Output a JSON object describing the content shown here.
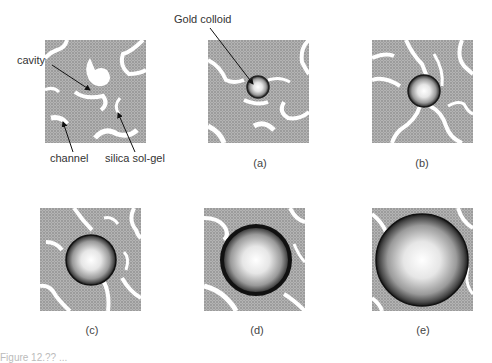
{
  "figure": {
    "annotations": {
      "cavity": "cavity",
      "channel": "channel",
      "silica": "silica sol-gel",
      "gold": "Gold colloid"
    },
    "panels": [
      {
        "id": "initial",
        "label": "",
        "particle_radius": 0
      },
      {
        "id": "a",
        "label": "(a)",
        "particle_radius": 11
      },
      {
        "id": "b",
        "label": "(b)",
        "particle_radius": 16
      },
      {
        "id": "c",
        "label": "(c)",
        "particle_radius": 25
      },
      {
        "id": "d",
        "label": "(d)",
        "particle_radius": 36
      },
      {
        "id": "e",
        "label": "(e)",
        "particle_radius": 46
      }
    ],
    "labels": {
      "a": "(a)",
      "b": "(b)",
      "c": "(c)",
      "d": "(d)",
      "e": "(e)"
    },
    "caption": "Figure 12.?? ...",
    "colors": {
      "gel": "#a8a8a8",
      "gel_dot": "#8a8a8a",
      "pore": "#ffffff",
      "particle_rim": "#111111",
      "particle_center": "#ffffff"
    }
  }
}
